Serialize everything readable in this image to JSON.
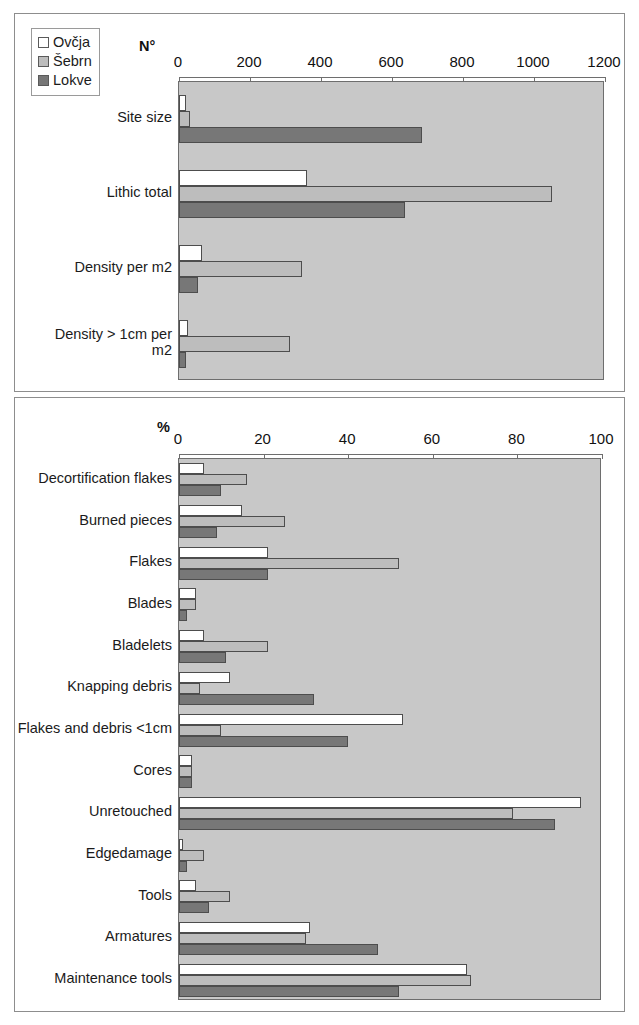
{
  "legend": {
    "items": [
      {
        "label": "Ovčja",
        "color": "#ffffff",
        "swatch_name": "legend-swatch-ovcja"
      },
      {
        "label": "Šebrn",
        "color": "#bdbdbd",
        "swatch_name": "legend-swatch-sebrn"
      },
      {
        "label": "Lokve",
        "color": "#777777",
        "swatch_name": "legend-swatch-lokve"
      }
    ]
  },
  "chart_data": [
    {
      "type": "bar",
      "orientation": "horizontal",
      "title": "",
      "xlabel": "N°",
      "ylabel": "",
      "xlim": [
        0,
        1200
      ],
      "xticks": [
        0,
        200,
        400,
        600,
        800,
        1000,
        1200
      ],
      "grid": false,
      "legend_position": "top-left",
      "categories": [
        "Site size",
        "Lithic total",
        "Density per m2",
        "Density > 1cm per\nm2"
      ],
      "series": [
        {
          "name": "Ovčja",
          "color": "#ffffff",
          "values": [
            20,
            360,
            65,
            25
          ]
        },
        {
          "name": "Šebrn",
          "color": "#bdbdbd",
          "values": [
            32,
            1052,
            346,
            313
          ]
        },
        {
          "name": "Lokve",
          "color": "#777777",
          "values": [
            684,
            637,
            54,
            20
          ]
        }
      ]
    },
    {
      "type": "bar",
      "orientation": "horizontal",
      "title": "",
      "xlabel": "%",
      "ylabel": "",
      "xlim": [
        0,
        100
      ],
      "xticks": [
        0,
        20,
        40,
        60,
        80,
        100
      ],
      "grid": false,
      "legend_position": "none",
      "categories": [
        "Decortification flakes",
        "Burned pieces",
        "Flakes",
        "Blades",
        "Bladelets",
        "Knapping debris",
        "Flakes and debris <1cm",
        "Cores",
        "Unretouched",
        "Edgedamage",
        "Tools",
        "Armatures",
        "Maintenance tools"
      ],
      "series": [
        {
          "name": "Ovčja",
          "color": "#ffffff",
          "values": [
            6,
            15,
            21,
            4,
            6,
            12,
            53,
            3,
            95,
            1,
            4,
            31,
            68
          ]
        },
        {
          "name": "Šebrn",
          "color": "#bdbdbd",
          "values": [
            16,
            25,
            52,
            4,
            21,
            5,
            10,
            3,
            79,
            6,
            12,
            30,
            69
          ]
        },
        {
          "name": "Lokve",
          "color": "#777777",
          "values": [
            10,
            9,
            21,
            2,
            11,
            32,
            40,
            3,
            89,
            2,
            7,
            47,
            52
          ]
        }
      ]
    }
  ]
}
